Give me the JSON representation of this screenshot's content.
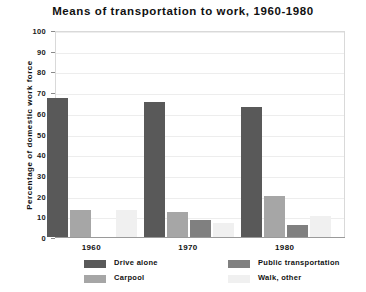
{
  "chart_data": {
    "type": "bar",
    "title": "Means of transportation to work, 1960-1980",
    "xlabel": "",
    "ylabel": "Percentage of domestic work force",
    "categories": [
      "1960",
      "1970",
      "1980"
    ],
    "ylim": [
      0,
      100
    ],
    "yticks": [
      "0",
      "10",
      "20",
      "30",
      "40",
      "50",
      "60",
      "70",
      "80",
      "90",
      "100"
    ],
    "grid": true,
    "legend_position": "bottom",
    "series": [
      {
        "name": "Drive alone",
        "color": "#595959",
        "values": [
          67,
          65,
          63
        ]
      },
      {
        "name": "Carpool",
        "color": "#a6a6a6",
        "values": [
          13,
          12,
          20
        ]
      },
      {
        "name": "Public transportation",
        "color": "#808080",
        "values": [
          0,
          8,
          6
        ]
      },
      {
        "name": "Walk, other",
        "color": "#f0f0f0",
        "values": [
          13,
          7,
          10
        ]
      }
    ]
  }
}
